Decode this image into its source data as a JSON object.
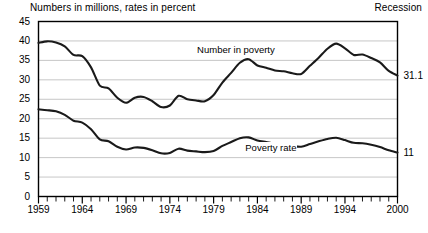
{
  "header": {
    "subtitle": "Numbers in millions, rates in percent",
    "recession_legend": "Recession"
  },
  "chart_data": {
    "type": "line",
    "title": "",
    "subtitle": "Numbers in millions, rates in percent",
    "xlabel": "",
    "ylabel": "",
    "xlim": [
      1959,
      2000
    ],
    "ylim": [
      0,
      45
    ],
    "grid": true,
    "legend_position": "inline-annotations",
    "y_ticks": [
      0,
      5,
      10,
      15,
      20,
      25,
      30,
      35,
      40,
      45
    ],
    "y_tick_labels": [
      "0",
      "5",
      "10",
      "15",
      "20",
      "25",
      "30",
      "35",
      "40",
      "45"
    ],
    "x_ticks": [
      1959,
      1964,
      1969,
      1974,
      1979,
      1984,
      1989,
      1994,
      2000
    ],
    "x_tick_labels": [
      "1959",
      "1964",
      "1969",
      "1974",
      "1979",
      "1984",
      "1989",
      "1994",
      "2000"
    ],
    "x_minor_tick_step": 1,
    "x": [
      1959,
      1960,
      1961,
      1962,
      1963,
      1964,
      1965,
      1966,
      1967,
      1968,
      1969,
      1970,
      1971,
      1972,
      1973,
      1974,
      1975,
      1976,
      1977,
      1978,
      1979,
      1980,
      1981,
      1982,
      1983,
      1984,
      1985,
      1986,
      1987,
      1988,
      1989,
      1990,
      1991,
      1992,
      1993,
      1994,
      1995,
      1996,
      1997,
      1998,
      1999,
      2000
    ],
    "series": [
      {
        "name": "Number in poverty",
        "units": "millions",
        "annotation": "Number in poverty",
        "end_label": "31.1",
        "color": "#1a1a1a",
        "values": [
          39.5,
          39.9,
          39.6,
          38.6,
          36.4,
          36.1,
          33.2,
          28.5,
          27.8,
          25.4,
          24.1,
          25.4,
          25.6,
          24.5,
          23.0,
          23.4,
          25.9,
          25.0,
          24.7,
          24.5,
          26.1,
          29.3,
          31.8,
          34.4,
          35.3,
          33.7,
          33.1,
          32.4,
          32.2,
          31.7,
          31.5,
          33.6,
          35.7,
          38.0,
          39.3,
          38.1,
          36.4,
          36.5,
          35.6,
          34.5,
          32.3,
          31.1
        ]
      },
      {
        "name": "Poverty rate",
        "units": "percent",
        "annotation": "Poverty rate",
        "end_label": "11",
        "color": "#1a1a1a",
        "values": [
          22.4,
          22.2,
          21.9,
          21.0,
          19.5,
          19.0,
          17.3,
          14.7,
          14.2,
          12.8,
          12.1,
          12.6,
          12.5,
          11.9,
          11.1,
          11.2,
          12.3,
          11.8,
          11.6,
          11.4,
          11.7,
          13.0,
          14.0,
          15.0,
          15.2,
          14.4,
          14.0,
          13.6,
          13.4,
          13.0,
          12.8,
          13.5,
          14.2,
          14.8,
          15.1,
          14.5,
          13.8,
          13.7,
          13.3,
          12.7,
          11.9,
          11.3
        ]
      }
    ]
  }
}
